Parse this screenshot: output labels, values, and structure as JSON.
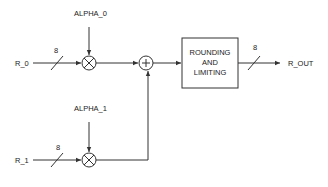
{
  "diagram": {
    "inputs": [
      {
        "label": "R_0",
        "bus_width": "8"
      },
      {
        "label": "R_1",
        "bus_width": "8"
      }
    ],
    "coefficients": [
      {
        "label": "ALPHA_0"
      },
      {
        "label": "ALPHA_1"
      }
    ],
    "multipliers": [
      {
        "symbol": "multiply"
      },
      {
        "symbol": "multiply"
      }
    ],
    "adder": {
      "symbol": "+"
    },
    "block": {
      "lines": [
        "ROUNDING",
        "AND",
        "LIMITING"
      ]
    },
    "output": {
      "label": "R_OUT",
      "bus_width": "8"
    }
  }
}
